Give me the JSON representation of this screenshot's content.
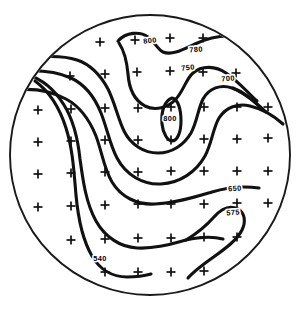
{
  "figure": {
    "name": "contour-map",
    "background_color": "#ffffff",
    "line_color": "#111111",
    "label_color": "#000000"
  },
  "boundary": {
    "shape": "circle",
    "center_x": 150,
    "center_y": 155,
    "radius": 140
  },
  "chart_data": {
    "type": "contour",
    "title": "",
    "xlabel": "",
    "ylabel": "",
    "grid": false,
    "legend": "none",
    "contour_levels": [
      540,
      575,
      650,
      700,
      750,
      780,
      800
    ],
    "labels": [
      {
        "text": "800",
        "x": 150,
        "y": 41,
        "rotate": -6
      },
      {
        "text": "780",
        "x": 196,
        "y": 50,
        "rotate": -4
      },
      {
        "text": "750",
        "x": 188,
        "y": 68,
        "rotate": -6
      },
      {
        "text": "700",
        "x": 228,
        "y": 79,
        "rotate": -4
      },
      {
        "text": "800",
        "x": 170,
        "y": 119,
        "rotate": 0
      },
      {
        "text": "650",
        "x": 235,
        "y": 189,
        "rotate": -3
      },
      {
        "text": "575",
        "x": 233,
        "y": 213,
        "rotate": -4
      },
      {
        "text": "540",
        "x": 100,
        "y": 259,
        "rotate": 0
      }
    ],
    "contours": [
      {
        "level": 800,
        "kind": "closed",
        "path": "M 172 98 C 164 101 161 112 162 124 C 163 134 168 141 172 141 C 177 141 181 133 181 121 C 181 109 178 99 172 98 Z"
      },
      {
        "level": 780,
        "kind": "open",
        "path": "M 118 41 C 126 32 140 31 148 37 C 155 42 157 49 163 52 C 172 56 184 49 195 44 C 210 37 228 34 244 38 C 258 41 268 49 276 58"
      },
      {
        "level": 780,
        "kind": "open",
        "path": "M 119 43 C 125 52 127 63 128 74 C 129 88 134 100 145 106 C 155 111 168 108 176 99 C 184 90 186 79 193 73 C 202 65 216 66 226 73 C 238 81 247 92 257 101"
      },
      {
        "level": 750,
        "kind": "open",
        "path": "M 29 58 C 45 56 62 55 77 60 C 92 65 101 76 108 89 C 115 103 118 119 124 131 C 131 145 144 153 158 153 C 172 153 184 145 191 133 C 197 122 198 109 203 99 C 209 88 221 84 232 88 C 245 93 256 103 266 112"
      },
      {
        "level": 700,
        "kind": "open",
        "path": "M 21 71 C 38 70 56 71 71 78 C 86 85 95 98 101 113 C 107 128 110 145 117 158 C 126 175 143 185 161 184 C 180 183 196 172 205 156 C 212 143 213 128 219 118 C 226 107 238 103 250 106 C 263 109 274 116 283 124"
      },
      {
        "level": 700,
        "kind": "open",
        "path": "M 233 88 C 244 92 253 100 261 108"
      },
      {
        "level": 650,
        "kind": "open",
        "path": "M 15 90 C 33 88 51 91 66 99 C 81 107 90 121 96 136 C 102 152 104 169 112 182 C 121 197 137 205 155 204 C 176 203 195 197 212 192 C 228 187 245 186 259 188"
      },
      {
        "level": 575,
        "kind": "open",
        "path": "M 26 74 C 42 79 55 90 64 105 C 74 121 78 140 80 159 C 83 181 86 203 96 221 C 105 237 120 247 137 248 C 155 249 171 244 186 240 C 199 237 212 236 223 239"
      },
      {
        "level": 575,
        "kind": "open",
        "path": "M 186 240 C 196 234 206 226 214 217 C 222 208 230 205 238 209 C 245 213 246 222 242 230 C 237 240 226 248 215 256 C 205 263 195 270 188 278"
      },
      {
        "level": 540,
        "kind": "open",
        "path": "M 35 81 C 50 92 60 109 66 128 C 73 150 74 173 76 195 C 78 217 82 239 92 256 C 100 270 113 277 127 277 C 136 277 144 276 151 274"
      }
    ],
    "stations": [
      {
        "x": 100,
        "y": 42
      },
      {
        "x": 135,
        "y": 40
      },
      {
        "x": 170,
        "y": 38
      },
      {
        "x": 203,
        "y": 38
      },
      {
        "x": 70,
        "y": 76
      },
      {
        "x": 105,
        "y": 74
      },
      {
        "x": 137,
        "y": 72
      },
      {
        "x": 170,
        "y": 71
      },
      {
        "x": 203,
        "y": 72
      },
      {
        "x": 236,
        "y": 73
      },
      {
        "x": 38,
        "y": 110
      },
      {
        "x": 71,
        "y": 109
      },
      {
        "x": 105,
        "y": 108
      },
      {
        "x": 138,
        "y": 108
      },
      {
        "x": 171,
        "y": 107
      },
      {
        "x": 204,
        "y": 107
      },
      {
        "x": 237,
        "y": 107
      },
      {
        "x": 268,
        "y": 107
      },
      {
        "x": 38,
        "y": 142
      },
      {
        "x": 71,
        "y": 141
      },
      {
        "x": 105,
        "y": 140
      },
      {
        "x": 138,
        "y": 140
      },
      {
        "x": 171,
        "y": 140
      },
      {
        "x": 204,
        "y": 139
      },
      {
        "x": 237,
        "y": 139
      },
      {
        "x": 268,
        "y": 138
      },
      {
        "x": 38,
        "y": 174
      },
      {
        "x": 71,
        "y": 173
      },
      {
        "x": 105,
        "y": 172
      },
      {
        "x": 138,
        "y": 172
      },
      {
        "x": 171,
        "y": 171
      },
      {
        "x": 204,
        "y": 171
      },
      {
        "x": 237,
        "y": 171
      },
      {
        "x": 268,
        "y": 171
      },
      {
        "x": 38,
        "y": 207
      },
      {
        "x": 71,
        "y": 206
      },
      {
        "x": 105,
        "y": 205
      },
      {
        "x": 138,
        "y": 204
      },
      {
        "x": 171,
        "y": 204
      },
      {
        "x": 204,
        "y": 204
      },
      {
        "x": 237,
        "y": 203
      },
      {
        "x": 268,
        "y": 203
      },
      {
        "x": 71,
        "y": 240
      },
      {
        "x": 105,
        "y": 239
      },
      {
        "x": 138,
        "y": 238
      },
      {
        "x": 171,
        "y": 238
      },
      {
        "x": 204,
        "y": 237
      },
      {
        "x": 237,
        "y": 237
      },
      {
        "x": 105,
        "y": 272
      },
      {
        "x": 138,
        "y": 272
      },
      {
        "x": 171,
        "y": 272
      },
      {
        "x": 204,
        "y": 271
      }
    ],
    "station_marker": {
      "symbol": "plus",
      "arm_length": 4.5
    }
  }
}
